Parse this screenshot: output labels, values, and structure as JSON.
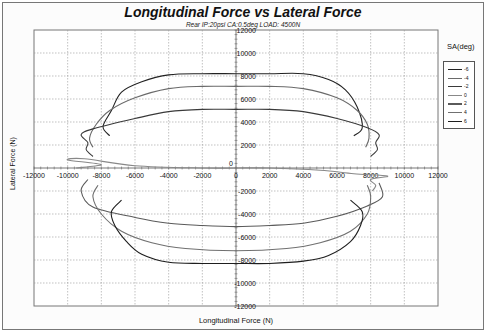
{
  "chart_data": {
    "type": "line",
    "title": "Longitudinal Force vs Lateral Force",
    "subtitle": "Rear IP:20psi CA:0.5deg LOAD: 4500N",
    "xlabel": "Longitudinal Force (N)",
    "ylabel": "Lateral Force (N)",
    "xlim": [
      -12000,
      12000
    ],
    "ylim": [
      -12000,
      12000
    ],
    "x_ticks": [
      "-12000",
      "-10000",
      "-8000",
      "-6000",
      "-4000",
      "-2000",
      "0",
      "2000",
      "4000",
      "6000",
      "8000",
      "10000",
      "12000"
    ],
    "y_ticks": [
      "12000",
      "10000",
      "8000",
      "6000",
      "4000",
      "2000",
      "0",
      "-2000",
      "-4000",
      "-6000",
      "-8000",
      "-10000",
      "-12000"
    ],
    "grid": true,
    "legend_title": "SA(deg)",
    "legend_position": "right",
    "series": [
      {
        "name": "-6",
        "color": "#222222",
        "points": [
          [
            -7500,
            2800
          ],
          [
            -7900,
            3600
          ],
          [
            -7400,
            5000
          ],
          [
            -6800,
            6600
          ],
          [
            -5600,
            7500
          ],
          [
            -4000,
            8100
          ],
          [
            -2000,
            8200
          ],
          [
            0,
            8200
          ],
          [
            2000,
            8200
          ],
          [
            4000,
            8200
          ],
          [
            5500,
            7700
          ],
          [
            6500,
            6800
          ],
          [
            7200,
            5300
          ],
          [
            7500,
            3500
          ],
          [
            7000,
            2800
          ]
        ]
      },
      {
        "name": "-4",
        "color": "#6a6a6a",
        "points": [
          [
            -8500,
            1800
          ],
          [
            -8700,
            2600
          ],
          [
            -8300,
            3800
          ],
          [
            -7500,
            5000
          ],
          [
            -6000,
            6100
          ],
          [
            -4000,
            6900
          ],
          [
            -2000,
            7100
          ],
          [
            0,
            7100
          ],
          [
            2000,
            7100
          ],
          [
            4000,
            6900
          ],
          [
            6000,
            6100
          ],
          [
            7200,
            5000
          ],
          [
            7800,
            3800
          ],
          [
            7900,
            2600
          ],
          [
            7700,
            1800
          ]
        ]
      },
      {
        "name": "-2",
        "color": "#3a3a3a",
        "points": [
          [
            -8500,
            1000
          ],
          [
            -8900,
            1600
          ],
          [
            -8800,
            2200
          ],
          [
            -9200,
            2900
          ],
          [
            -8500,
            3400
          ],
          [
            -6000,
            4300
          ],
          [
            -4000,
            4900
          ],
          [
            -2000,
            5100
          ],
          [
            0,
            5100
          ],
          [
            2000,
            5100
          ],
          [
            4000,
            4900
          ],
          [
            6000,
            4300
          ],
          [
            7800,
            3500
          ],
          [
            8500,
            2900
          ],
          [
            8300,
            2200
          ],
          [
            8400,
            1600
          ],
          [
            8000,
            1000
          ]
        ]
      },
      {
        "name": "0",
        "color": "#888888",
        "points": [
          [
            -9500,
            0
          ],
          [
            -8000,
            300
          ],
          [
            -10000,
            700
          ],
          [
            -9000,
            800
          ],
          [
            -6000,
            200
          ],
          [
            -2000,
            0
          ],
          [
            0,
            0
          ],
          [
            2000,
            0
          ],
          [
            5000,
            -200
          ],
          [
            7000,
            -500
          ],
          [
            9000,
            -700
          ],
          [
            8000,
            -1000
          ],
          [
            8300,
            -1500
          ],
          [
            8100,
            -2000
          ]
        ]
      },
      {
        "name": "2",
        "color": "#5a5a5a",
        "points": [
          [
            -8800,
            -1000
          ],
          [
            -9200,
            -2000
          ],
          [
            -8500,
            -3400
          ],
          [
            -6000,
            -4300
          ],
          [
            -4000,
            -4800
          ],
          [
            -2000,
            -5000
          ],
          [
            0,
            -5100
          ],
          [
            2000,
            -5000
          ],
          [
            4000,
            -4800
          ],
          [
            6000,
            -4200
          ],
          [
            7800,
            -3300
          ],
          [
            8700,
            -2500
          ],
          [
            8500,
            -1300
          ]
        ]
      },
      {
        "name": "4",
        "color": "#707070",
        "points": [
          [
            -8200,
            -1500
          ],
          [
            -8500,
            -2500
          ],
          [
            -8000,
            -4000
          ],
          [
            -6800,
            -5500
          ],
          [
            -5000,
            -6500
          ],
          [
            -3000,
            -7000
          ],
          [
            0,
            -7200
          ],
          [
            3000,
            -7000
          ],
          [
            5000,
            -6500
          ],
          [
            6800,
            -5500
          ],
          [
            7800,
            -4000
          ],
          [
            8000,
            -2500
          ],
          [
            7800,
            -1500
          ]
        ]
      },
      {
        "name": "6",
        "color": "#1e1e1e",
        "points": [
          [
            -6800,
            -2800
          ],
          [
            -7400,
            -3800
          ],
          [
            -7200,
            -5000
          ],
          [
            -6500,
            -6400
          ],
          [
            -5600,
            -7500
          ],
          [
            -4000,
            -8200
          ],
          [
            -2000,
            -8300
          ],
          [
            0,
            -8300
          ],
          [
            2000,
            -8300
          ],
          [
            4000,
            -8100
          ],
          [
            5500,
            -7600
          ],
          [
            6800,
            -6400
          ],
          [
            7400,
            -5000
          ],
          [
            7500,
            -3800
          ],
          [
            6800,
            -2800
          ]
        ]
      }
    ]
  }
}
